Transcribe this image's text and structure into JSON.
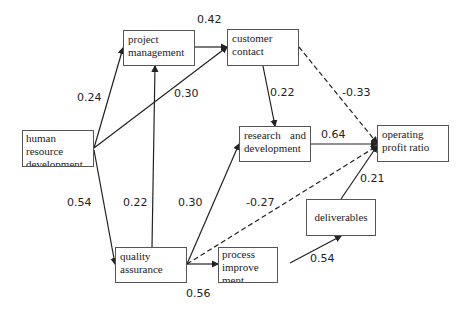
{
  "nodes": {
    "project_management": "project management",
    "customer_contact": "customer contact",
    "human_resource_development": "human resource development",
    "research_and_development": "research and development",
    "operating_profit_ratio": "operating profit ratio",
    "quality_assurance": "quality assurance",
    "process_improvement": "process improve ment",
    "deliverables": "deliverables"
  },
  "edges": [
    {
      "from": "human resource development",
      "to": "project management",
      "coef": "0.24",
      "style": "solid"
    },
    {
      "from": "human resource development",
      "to": "customer contact",
      "coef": "0.30",
      "style": "solid"
    },
    {
      "from": "human resource development",
      "to": "quality assurance",
      "coef": "0.54",
      "style": "solid"
    },
    {
      "from": "project management",
      "to": "customer contact",
      "coef": "0.42",
      "style": "solid"
    },
    {
      "from": "quality assurance",
      "to": "project management",
      "coef": "0.22",
      "style": "solid"
    },
    {
      "from": "quality assurance",
      "to": "research and development",
      "coef": "0.30",
      "style": "solid"
    },
    {
      "from": "quality assurance",
      "to": "process improvement",
      "coef": "0.56",
      "style": "solid"
    },
    {
      "from": "quality assurance",
      "to": "operating profit ratio",
      "coef": "-0.27",
      "style": "dashed"
    },
    {
      "from": "customer contact",
      "to": "research and development",
      "coef": "0.22",
      "style": "solid"
    },
    {
      "from": "customer contact",
      "to": "operating profit ratio",
      "coef": "-0.33",
      "style": "dashed"
    },
    {
      "from": "research and development",
      "to": "operating profit ratio",
      "coef": "0.64",
      "style": "solid"
    },
    {
      "from": "process improvement",
      "to": "deliverables",
      "coef": "0.54",
      "style": "solid"
    },
    {
      "from": "deliverables",
      "to": "operating profit ratio",
      "coef": "0.21",
      "style": "solid"
    }
  ]
}
